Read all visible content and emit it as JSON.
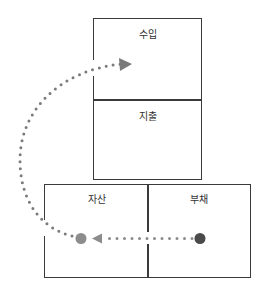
{
  "diagram": {
    "boxes": {
      "revenue": {
        "label": "수입"
      },
      "expense": {
        "label": "지출"
      },
      "asset": {
        "label": "자산"
      },
      "liability": {
        "label": "부채"
      }
    },
    "nodes": {
      "asset_dot_color": "#8c8c8c",
      "liability_dot_color": "#4a4a4a"
    },
    "arrows": [
      {
        "from": "liability",
        "to": "asset",
        "style": "dotted",
        "color": "#8c8c8c"
      },
      {
        "from": "asset",
        "to": "revenue",
        "style": "dotted-curve",
        "color": "#7a7a7a"
      }
    ]
  }
}
